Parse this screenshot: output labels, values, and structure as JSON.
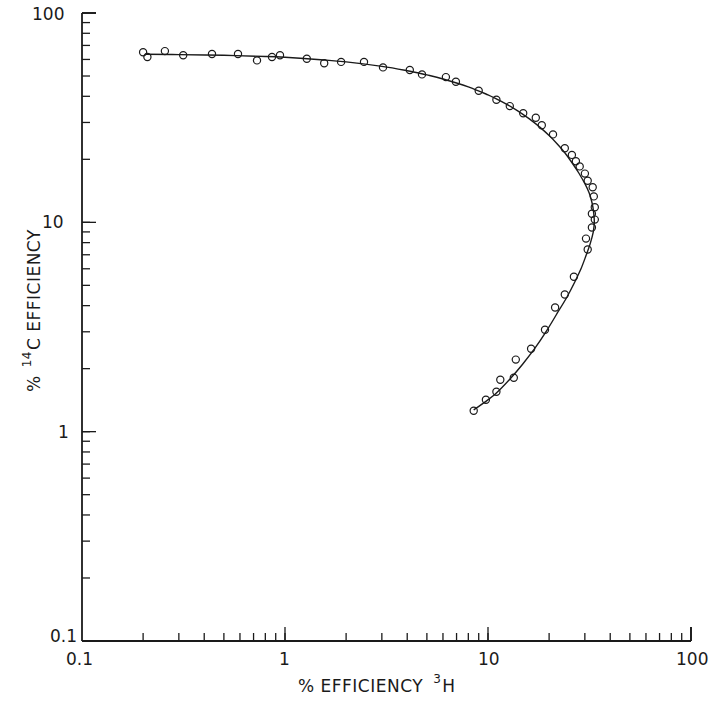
{
  "chart_data": {
    "type": "scatter",
    "title": "",
    "xlabel": "% EFFICIENCY 3H",
    "xlabel_parts": {
      "prefix": "% EFFICIENCY",
      "sup": "3",
      "suffix": "H"
    },
    "ylabel": "% 14C EFFICIENCY",
    "ylabel_parts": {
      "prefix": "%",
      "sup": "14",
      "suffix": "C EFFICIENCY"
    },
    "xscale": "log",
    "yscale": "log",
    "xlim": [
      0.1,
      100
    ],
    "ylim": [
      0.1,
      100
    ],
    "x_tick_labels": [
      "0.1",
      "1",
      "10",
      "100"
    ],
    "y_tick_labels": [
      "0.1",
      "1",
      "10",
      "100"
    ],
    "y_origin_label": "0.1",
    "grid": false,
    "legend": null,
    "series": [
      {
        "name": "measured",
        "style": "open-circle",
        "points": [
          [
            0.2,
            65.0
          ],
          [
            0.21,
            61.6
          ],
          [
            0.256,
            65.8
          ],
          [
            0.315,
            62.8
          ],
          [
            0.437,
            63.7
          ],
          [
            0.587,
            63.7
          ],
          [
            0.728,
            59.4
          ],
          [
            0.863,
            61.6
          ],
          [
            0.945,
            62.8
          ],
          [
            1.28,
            60.5
          ],
          [
            1.56,
            57.5
          ],
          [
            1.89,
            58.4
          ],
          [
            2.45,
            58.4
          ],
          [
            3.04,
            55.0
          ],
          [
            4.12,
            53.4
          ],
          [
            4.73,
            50.9
          ],
          [
            6.2,
            49.4
          ],
          [
            6.95,
            46.9
          ],
          [
            9.0,
            42.5
          ],
          [
            11.0,
            38.5
          ],
          [
            12.8,
            35.9
          ],
          [
            14.9,
            33.2
          ],
          [
            17.2,
            31.6
          ],
          [
            18.4,
            29.1
          ],
          [
            20.9,
            26.3
          ],
          [
            23.9,
            22.6
          ],
          [
            25.9,
            21.0
          ],
          [
            27.1,
            19.6
          ],
          [
            28.3,
            18.5
          ],
          [
            30.0,
            17.1
          ],
          [
            31.0,
            15.8
          ],
          [
            32.8,
            14.7
          ],
          [
            33.2,
            13.3
          ],
          [
            33.6,
            11.8
          ],
          [
            32.5,
            11.0
          ],
          [
            33.6,
            10.3
          ],
          [
            32.5,
            9.45
          ],
          [
            30.4,
            8.36
          ],
          [
            31.0,
            7.42
          ],
          [
            26.5,
            5.5
          ],
          [
            23.9,
            4.52
          ],
          [
            21.4,
            3.92
          ],
          [
            19.1,
            3.07
          ],
          [
            16.3,
            2.49
          ],
          [
            13.7,
            2.21
          ],
          [
            11.5,
            1.77
          ],
          [
            13.4,
            1.81
          ],
          [
            11.0,
            1.55
          ],
          [
            9.77,
            1.42
          ],
          [
            8.5,
            1.26
          ]
        ]
      },
      {
        "name": "fitted curve",
        "style": "line",
        "points": [
          [
            0.205,
            63.5
          ],
          [
            0.3,
            63.3
          ],
          [
            0.5,
            62.8
          ],
          [
            0.8,
            62.0
          ],
          [
            1.0,
            61.4
          ],
          [
            1.5,
            59.8
          ],
          [
            2.0,
            58.4
          ],
          [
            3.0,
            55.6
          ],
          [
            4.0,
            53.0
          ],
          [
            5.0,
            50.6
          ],
          [
            6.0,
            48.4
          ],
          [
            8.0,
            44.4
          ],
          [
            10.0,
            40.6
          ],
          [
            12.0,
            37.2
          ],
          [
            14.0,
            34.1
          ],
          [
            16.0,
            31.2
          ],
          [
            18.0,
            28.5
          ],
          [
            20.0,
            26.0
          ],
          [
            22.0,
            23.6
          ],
          [
            24.0,
            21.4
          ],
          [
            26.0,
            19.2
          ],
          [
            28.0,
            17.2
          ],
          [
            30.0,
            15.3
          ],
          [
            31.5,
            13.8
          ],
          [
            32.6,
            12.3
          ],
          [
            33.2,
            11.0
          ],
          [
            33.4,
            10.0
          ],
          [
            33.0,
            9.0
          ],
          [
            32.0,
            8.0
          ],
          [
            30.5,
            7.0
          ],
          [
            28.7,
            6.0
          ],
          [
            26.8,
            5.2
          ],
          [
            24.5,
            4.4
          ],
          [
            22.0,
            3.7
          ],
          [
            19.5,
            3.05
          ],
          [
            17.0,
            2.5
          ],
          [
            14.8,
            2.1
          ],
          [
            12.8,
            1.78
          ],
          [
            11.0,
            1.53
          ],
          [
            9.6,
            1.38
          ],
          [
            8.5,
            1.27
          ]
        ]
      }
    ]
  }
}
